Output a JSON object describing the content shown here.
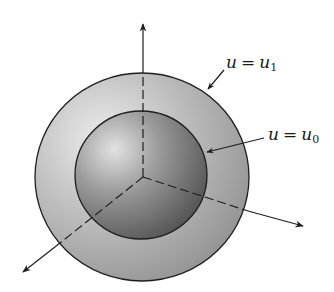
{
  "figure": {
    "outer_surface": {
      "label_lhs": "u",
      "label_eq": "=",
      "label_rhs_var": "u",
      "label_rhs_sub": "1"
    },
    "inner_surface": {
      "label_lhs": "u",
      "label_eq": "=",
      "label_rhs_var": "u",
      "label_rhs_sub": "0"
    },
    "axes": [
      "vertical-axis",
      "right-axis",
      "left-axis"
    ],
    "colors": {
      "outer_shell": "#a8a8a8",
      "outer_shell_light": "#e6e6e6",
      "inner_sphere": "#6e6e6e",
      "inner_sphere_light": "#d9d9d9",
      "stroke": "#1e1e1e"
    }
  }
}
